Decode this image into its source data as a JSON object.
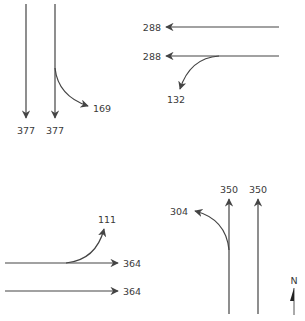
{
  "diagram": {
    "type": "turning-movement-volumes",
    "approaches": {
      "southbound": {
        "movements": [
          {
            "type": "through",
            "volume": "377"
          },
          {
            "type": "through",
            "volume": "377"
          },
          {
            "type": "left-turn",
            "volume": "169"
          }
        ]
      },
      "westbound": {
        "movements": [
          {
            "type": "through",
            "volume": "288"
          },
          {
            "type": "through",
            "volume": "288"
          },
          {
            "type": "left-turn",
            "volume": "132"
          }
        ]
      },
      "eastbound": {
        "movements": [
          {
            "type": "left-turn",
            "volume": "111"
          },
          {
            "type": "through",
            "volume": "364"
          },
          {
            "type": "through",
            "volume": "364"
          }
        ]
      },
      "northbound": {
        "movements": [
          {
            "type": "left-turn",
            "volume": "304"
          },
          {
            "type": "through",
            "volume": "350"
          },
          {
            "type": "through",
            "volume": "350"
          }
        ]
      }
    },
    "north_arrow": {
      "label": "N"
    }
  }
}
